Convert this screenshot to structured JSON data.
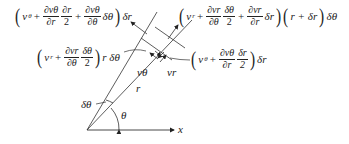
{
  "diagram": {
    "axis": {
      "x_label": "x"
    },
    "angles": {
      "theta": "θ",
      "delta_theta": "δθ"
    },
    "radius_label": "r",
    "velocity_labels": {
      "v_theta": "vθ",
      "v_r": "vr"
    },
    "expressions": {
      "top_left": {
        "lead": "v",
        "lead_sub": "θ",
        "plus1": "+",
        "frac1_num": "∂vθ",
        "frac1_den": "∂r",
        "frac2_num": "∂r",
        "frac2_den": "2",
        "plus2": "+",
        "frac3_num": "∂vθ",
        "frac3_den": "∂θ",
        "tail_in": "δθ",
        "tail_out": "δr"
      },
      "top_right": {
        "lead": "v",
        "lead_sub": "r",
        "plus1": "+",
        "frac1_num": "∂vr",
        "frac1_den": "∂θ",
        "frac2_num": "δθ",
        "frac2_den": "2",
        "plus2": "+",
        "frac3_num": "∂vr",
        "frac3_den": "∂r",
        "tail_in": "δr",
        "second_factor": "r + δr",
        "tail_out": "δθ"
      },
      "mid_left": {
        "lead": "v",
        "lead_sub": "r",
        "plus1": "+",
        "frac1_num": "∂vr",
        "frac1_den": "∂θ",
        "frac2_num": "δθ",
        "frac2_den": "2",
        "tail_out": "r δθ"
      },
      "mid_right": {
        "lead": "v",
        "lead_sub": "θ",
        "plus1": "+",
        "frac1_num": "∂vθ",
        "frac1_den": "∂r",
        "frac2_num": "δr",
        "frac2_den": "2",
        "tail_out": "δr"
      }
    }
  }
}
